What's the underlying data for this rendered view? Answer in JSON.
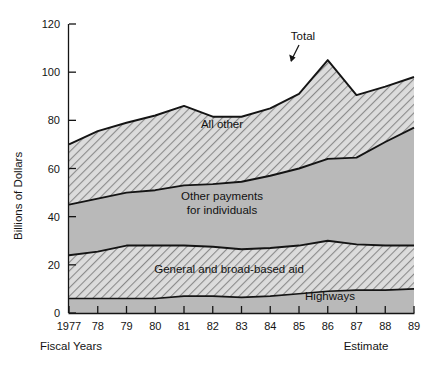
{
  "chart_data": {
    "type": "area",
    "stacked": true,
    "title": "",
    "subtitle": "",
    "xlabel": "Fiscal Years",
    "ylabel": "Billions of Dollars",
    "x": [
      "1977",
      "78",
      "79",
      "80",
      "81",
      "82",
      "83",
      "84",
      "85",
      "86",
      "87",
      "88",
      "89"
    ],
    "x_tick_labels": [
      "1977",
      "78",
      "79",
      "80",
      "81",
      "82",
      "83",
      "84",
      "85",
      "86",
      "87",
      "88",
      "89"
    ],
    "y_tick_labels": [
      "0",
      "20",
      "40",
      "60",
      "80",
      "100",
      "120"
    ],
    "y_ticks": [
      0,
      20,
      40,
      60,
      80,
      100,
      120
    ],
    "ylim": [
      0,
      120
    ],
    "grid": false,
    "legend_position": "inline-annotations",
    "series": [
      {
        "name": "Highways",
        "label": "Highways",
        "fill": "#b9b9b9",
        "pattern": "solid",
        "values": [
          6,
          6,
          6,
          6,
          7,
          7,
          6.5,
          7,
          8,
          9,
          9.5,
          9.5,
          10
        ]
      },
      {
        "name": "General and broad-based aid",
        "label": "General and broad-based aid",
        "fill": "#d6d6d6",
        "pattern": "hatch-right",
        "values": [
          18,
          19.5,
          22,
          22,
          21,
          20.5,
          20,
          20,
          20,
          21,
          19,
          18.5,
          18
        ]
      },
      {
        "name": "Other payments for individuals",
        "label": "Other payments for individuals",
        "fill": "#b9b9b9",
        "pattern": "solid",
        "values": [
          21,
          22,
          22,
          23,
          25,
          26,
          28,
          30,
          32,
          34,
          36,
          43,
          49
        ]
      },
      {
        "name": "All other",
        "label": "All other",
        "fill": "#d6d6d6",
        "pattern": "hatch-right",
        "values": [
          25,
          28,
          29,
          31,
          33,
          28,
          27,
          28,
          31,
          41,
          26,
          23,
          21
        ]
      }
    ],
    "totals": [
      70,
      75.5,
      79,
      82,
      86,
      81.5,
      81.5,
      85,
      91,
      105,
      90.5,
      94,
      98
    ],
    "annotations": [
      {
        "name": "total-callout",
        "text": "Total",
        "x": 1985.5,
        "y": 104
      },
      {
        "name": "estimate-note",
        "text": "Estimate",
        "x": 1987.5,
        "y": -14
      }
    ]
  },
  "axes": {
    "y_title": "Billions of Dollars",
    "x_title": "Fiscal Years",
    "estimate_note": "Estimate"
  },
  "labels": {
    "total": "Total",
    "all_other": "All other",
    "other_payments_line1": "Other payments",
    "other_payments_line2": "for individuals",
    "general_aid": "General and broad-based aid",
    "highways": "Highways"
  },
  "colors": {
    "solid_fill": "#b9b9b9",
    "hatch_fill": "#d6d6d6",
    "hatch_stroke": "#7a7a7a",
    "line": "#141414",
    "background": "#ffffff"
  }
}
